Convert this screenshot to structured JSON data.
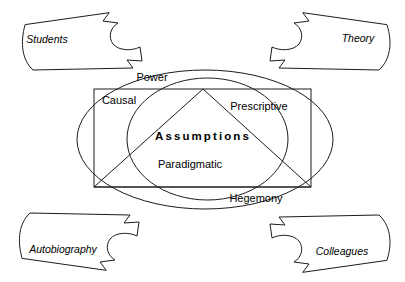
{
  "diagram": {
    "title": "Assumptions",
    "core_label": "Assumptions",
    "canvas": {
      "width": 405,
      "height": 282,
      "background": "#ffffff"
    },
    "stroke_color": "#1c1c1c",
    "text_color": "#000000",
    "inner_labels": [
      {
        "text": "Power",
        "x": 152,
        "y": 78
      },
      {
        "text": "Causal",
        "x": 119,
        "y": 101
      },
      {
        "text": "Prescriptive",
        "x": 259,
        "y": 107
      },
      {
        "text": "Assumptions",
        "x": 203,
        "y": 137
      },
      {
        "text": "Paradigmatic",
        "x": 190,
        "y": 165
      },
      {
        "text": "Hegemony",
        "x": 256,
        "y": 199
      }
    ],
    "callouts": [
      {
        "text": "Students",
        "position": "top-left",
        "x": 47,
        "y": 40
      },
      {
        "text": "Theory",
        "position": "top-right",
        "x": 358,
        "y": 39
      },
      {
        "text": "Autobiography",
        "position": "bottom-left",
        "x": 63,
        "y": 250
      },
      {
        "text": "Colleagues",
        "position": "bottom-right",
        "x": 342,
        "y": 252
      }
    ],
    "shapes": {
      "outer_ellipse": {
        "cx": 205,
        "cy": 139.5,
        "rx": 128,
        "ry": 69.5
      },
      "inner_ellipse": {
        "cx": 207.5,
        "cy": 139,
        "rx": 80.5,
        "ry": 61
      },
      "rectangle": {
        "x": 94,
        "y": 89,
        "width": 217,
        "height": 98
      },
      "triangle": {
        "apex_x": 203,
        "apex_y": 89,
        "left_x": 94,
        "left_y": 187,
        "right_x": 311,
        "right_y": 187
      }
    }
  }
}
